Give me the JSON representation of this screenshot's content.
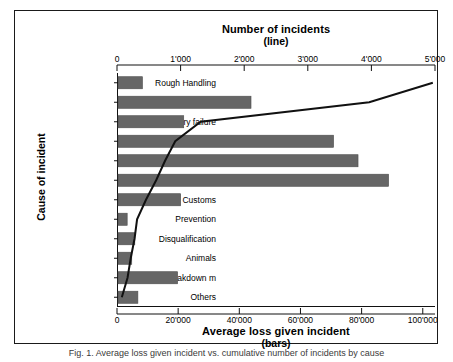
{
  "caption": "Fig. 1. Average loss given incident vs. cumulative number of incidents by cause",
  "chart_data": {
    "type": "bar",
    "orientation": "horizontal",
    "title": "",
    "categories": [
      "Rough Handling",
      "Theft",
      "Delivery failure",
      "Environmental con",
      "Collision",
      "Temperatures",
      "Customs",
      "Prevention",
      "Disqualification",
      "Animals",
      "Machine breakdown m",
      "Others"
    ],
    "series": [
      {
        "name": "Average loss given incident",
        "type": "bar",
        "axis": "bottom",
        "unit": "currency",
        "color": "#666666",
        "values": [
          8000,
          43500,
          21500,
          70500,
          78500,
          88500,
          20500,
          3000,
          5500,
          4500,
          19500,
          6500
        ]
      },
      {
        "name": "Number of incidents",
        "type": "line",
        "axis": "top",
        "color": "#111111",
        "cumulative": true,
        "values": [
          4950,
          3950,
          1300,
          900,
          740,
          600,
          440,
          300,
          260,
          200,
          150,
          60
        ]
      }
    ],
    "bottom_axis": {
      "label": "Average loss given incident",
      "sublabel": "(bars)",
      "ticks": [
        0,
        20000,
        40000,
        60000,
        80000,
        100000
      ],
      "tick_labels": [
        "0",
        "20'000",
        "40'000",
        "60'000",
        "80'000",
        "100'000"
      ],
      "min": 0,
      "max": 104000
    },
    "top_axis": {
      "label": "Number of incidents",
      "sublabel": "(line)",
      "ticks": [
        0,
        1000,
        2000,
        3000,
        4000,
        5000
      ],
      "tick_labels": [
        "0",
        "1'000",
        "2'000",
        "3'000",
        "4'000",
        "5'000"
      ],
      "min": 0,
      "max": 5000
    },
    "y_axis": {
      "label": "Cause of incident"
    },
    "grid": false,
    "legend": "none"
  }
}
